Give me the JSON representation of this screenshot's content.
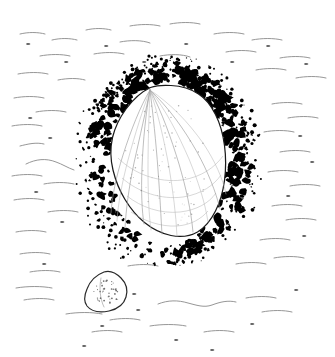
{
  "figure": {
    "domain": "natural-image",
    "kind": "scientific-pen-and-ink-illustration",
    "background_color": "#ffffff",
    "ink_color": "#000000",
    "line_color": "#1a1a1a",
    "hatch_color": "#8a8a8a",
    "stipple_color": "#6e6e6e",
    "width": 335,
    "height": 357,
    "caption": "",
    "title": "",
    "labels": [],
    "scale_bar": "",
    "elements": [
      {
        "name": "main-shell",
        "description": "large teardrop / pear shaped limpet shell in dorsal view with radiating ribs from apex",
        "apex_point": [
          150,
          88
        ],
        "bounds": [
          110,
          85,
          226,
          248
        ]
      },
      {
        "name": "encrusting-ring",
        "description": "dense irregular black blotched ring of encrusting organisms surrounding the main shell",
        "bounds": [
          80,
          60,
          256,
          265
        ]
      },
      {
        "name": "small-shell",
        "description": "smaller detached shell view below left with stippled interior",
        "bounds": [
          84,
          271,
          127,
          312
        ]
      },
      {
        "name": "background-hatching",
        "description": "sparse thin wavy horizontal pen strokes suggesting substrate or water surface"
      }
    ]
  },
  "main_shell": {
    "outline_path": "M150.5 87.5 C141 92 133 99.5 126 109 C119.5 118 115 127 112.5 137.5 C110 148.5 110.5 159.5 113 170 C115.5 180.5 119.5 190.5 125 199.5 C130.5 208.5 137 216.5 144.5 222.5 C152.5 229 161.5 233.5 171 235.5 C180.5 237.5 189.5 236.5 197.5 232 C205 227.5 211 220 215.5 211 C220 202 223 191.5 224.5 180.5 C226 169 226 157 224.5 145.5 C223 134 220 123.5 215.5 114.5 C211 105.5 205.5 98.5 198.5 94 C191 89 181 86 171 85.5 C163.5 85 156 85.5 150.5 87.5 Z",
    "ribs": [
      "M150 90 C146 112 143 140 142 168 C141 192 142 212 144 224",
      "M150 90 C149 114 148 142 148 170 C148 195 149 216 151 230",
      "M150 90 C153 114 156 142 158 170 C160 196 161 218 162 234",
      "M150 90 C158 113 164 140 169 167 C173 192 176 214 177 236",
      "M150 90 C162 112 171 138 179 164 C186 188 191 210 193 232",
      "M150 90 C166 110 178 134 189 159 C198 181 205 202 208 222",
      "M150 90 C169 108 184 129 197 152 C208 172 216 192 220 209",
      "M150 90 C171 104 188 122 203 143 C215 161 223 179 226 194",
      "M150 90 C146 110 140 136 134 163 C129 187 126 209 125 228",
      "M150 90 C143 109 135 134 128 160 C122 183 118 204 117 221",
      "M150 90 C140 107 131 130 123 155 C116 177 112 197 111 213"
    ],
    "growth_lines": [
      "M127 196 C141 207 160 214 180 212 C197 210 209 203 216 193",
      "M122 178 C138 192 161 200 183 197 C202 194 214 185 221 175",
      "M118 158 C134 174 159 183 182 180 C202 177 215 167 223 156",
      "M131 212 C144 221 161 227 177 226 C191 225 201 219 208 211"
    ]
  },
  "small_shell": {
    "outline_path": "M104 272 C96 275 90 281 87 289 C84 296 84 302 87 306 C91 311 99 313 109 311 C118 309 124 304 126 297 C128 290 126 283 121 278 C116 273 110 270 104 272 Z",
    "stipple_count": 40,
    "rib_hint_path": "M101 278 C99 288 100 299 104 307"
  },
  "background_strokes": [
    "M20 34 C28 32 38 32 45 34",
    "M52 40 C60 38 70 38 77 40",
    "M86 30 C94 28 104 28 111 30",
    "M120 42 C130 40 142 40 150 43",
    "M130 26 C140 24 152 24 160 26",
    "M170 24 C180 22 192 22 200 24",
    "M214 34 C224 32 236 32 244 34",
    "M252 40 C262 38 274 38 282 40",
    "M40 56 C50 54 62 54 70 56",
    "M94 54 C104 52 116 52 124 54",
    "M160 56 C170 54 182 54 190 57",
    "M226 52 C236 50 248 50 256 52",
    "M280 58 C290 56 302 56 310 58",
    "M18 74 C28 72 40 72 48 74",
    "M58 80 C68 78 78 78 85 80",
    "M256 70 C266 68 278 68 286 70",
    "M296 78 C306 76 318 76 326 78",
    "M14 98 C24 96 36 96 44 98",
    "M36 112 C46 110 58 110 66 112",
    "M12 126 C22 124 34 124 42 126",
    "M272 104 C282 102 294 102 302 104",
    "M288 118 C298 116 310 116 318 118",
    "M264 132 C274 130 286 130 294 132",
    "M20 146 C28 144 36 142 44 144",
    "M26 164 C36 159 46 158 56 162 C62 164 68 168 74 170",
    "M12 176 C22 174 34 174 42 176",
    "M44 184 C54 182 66 182 74 184",
    "M280 152 C290 150 302 150 310 152",
    "M268 172 C278 170 290 170 298 172",
    "M290 186 C300 184 312 184 320 186",
    "M14 200 C24 198 36 198 44 200",
    "M48 212 C58 210 70 210 78 212",
    "M272 206 C282 204 294 204 302 206",
    "M286 220 C296 218 308 218 316 220",
    "M16 232 C26 230 38 230 46 232",
    "M260 240 C270 238 282 238 290 240",
    "M20 254 C30 252 42 252 50 254",
    "M274 258 C284 256 296 256 304 258",
    "M30 272 C40 270 52 270 60 272",
    "M128 266 C138 264 150 264 158 266",
    "M236 264 C246 262 258 262 266 264",
    "M16 288 C28 286 42 286 52 288",
    "M24 300 C34 298 46 298 54 300",
    "M66 314 C78 312 92 312 102 314",
    "M110 320 C120 318 132 318 140 320",
    "M158 304 C168 300 178 300 188 303 C196 305 204 308 212 305 C220 302 228 300 236 302",
    "M246 298 C256 296 268 296 276 298",
    "M150 326 C162 324 176 324 186 326",
    "M204 332 C214 330 226 330 234 332",
    "M92 332 C102 330 114 330 122 332",
    "M262 312 C272 310 284 310 292 312"
  ],
  "background_dots": [
    [
      28,
      44
    ],
    [
      66,
      62
    ],
    [
      106,
      46
    ],
    [
      144,
      62
    ],
    [
      186,
      44
    ],
    [
      232,
      62
    ],
    [
      268,
      46
    ],
    [
      306,
      64
    ],
    [
      30,
      118
    ],
    [
      50,
      138
    ],
    [
      300,
      136
    ],
    [
      312,
      162
    ],
    [
      36,
      192
    ],
    [
      62,
      222
    ],
    [
      288,
      196
    ],
    [
      304,
      236
    ],
    [
      44,
      264
    ],
    [
      102,
      326
    ],
    [
      176,
      340
    ],
    [
      252,
      324
    ],
    [
      134,
      294
    ],
    [
      138,
      310
    ],
    [
      84,
      346
    ],
    [
      212,
      350
    ],
    [
      296,
      290
    ]
  ]
}
